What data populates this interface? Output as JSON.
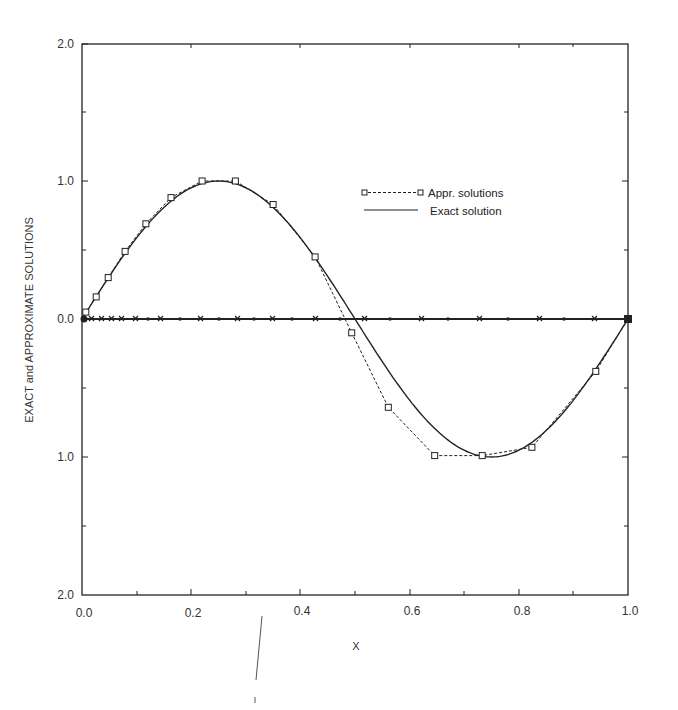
{
  "chart_data": {
    "type": "line",
    "title": "",
    "xlabel": "X",
    "ylabel": "EXACT and APPROXIMATE SOLUTIONS",
    "xlim": [
      0.0,
      1.0
    ],
    "ylim": [
      -2.0,
      2.0
    ],
    "x_ticks": [
      "0.0",
      "0.2",
      "0.4",
      "0.6",
      "0.8",
      "1.0"
    ],
    "y_ticks": [
      "2.0",
      "1.0",
      "0.0",
      "1.0",
      "2.0"
    ],
    "y_tick_values": [
      2.0,
      1.0,
      0.0,
      -1.0,
      -2.0
    ],
    "grid": false,
    "legend_position": "upper right (inside)",
    "legend": [
      {
        "label": "Appr. solutions",
        "style": "dashed line with square markers"
      },
      {
        "label": "Exact solution",
        "style": "solid line"
      }
    ],
    "series": [
      {
        "name": "Appr. solutions",
        "marker": "square",
        "line": "dashed",
        "x": [
          0.0,
          0.007,
          0.026,
          0.048,
          0.079,
          0.117,
          0.163,
          0.22,
          0.281,
          0.35,
          0.427,
          0.494,
          0.561,
          0.646,
          0.733,
          0.824,
          0.941,
          1.0
        ],
        "y": [
          0.0,
          0.05,
          0.16,
          0.3,
          0.49,
          0.69,
          0.88,
          1.0,
          1.0,
          0.83,
          0.45,
          -0.1,
          -0.64,
          -0.99,
          -0.99,
          -0.93,
          -0.38,
          0.0
        ]
      },
      {
        "name": "Exact solution",
        "line": "solid",
        "function": "sin(2*pi*x)",
        "x": [
          0.0,
          0.1,
          0.2,
          0.25,
          0.3,
          0.4,
          0.5,
          0.6,
          0.7,
          0.75,
          0.8,
          0.9,
          1.0
        ],
        "y": [
          0.0,
          0.588,
          0.951,
          1.0,
          0.951,
          0.588,
          0.0,
          -0.588,
          -0.951,
          -1.0,
          -0.951,
          -0.588,
          0.0
        ]
      },
      {
        "name": "zero baseline (x and dot markers)",
        "line": "solid",
        "marker": "x / dot alternating",
        "x": [
          0.0,
          0.018,
          0.036,
          0.054,
          0.073,
          0.1,
          0.128,
          0.165,
          0.201,
          0.238,
          0.284,
          0.33,
          0.385,
          0.44,
          0.495,
          0.55,
          0.605,
          0.66,
          0.715,
          0.77,
          0.825,
          0.88,
          0.94,
          1.0
        ],
        "y": [
          0,
          0,
          0,
          0,
          0,
          0,
          0,
          0,
          0,
          0,
          0,
          0,
          0,
          0,
          0,
          0,
          0,
          0,
          0,
          0,
          0,
          0,
          0,
          0
        ]
      }
    ]
  },
  "axes": {
    "x_title": "X",
    "y_title": "EXACT and APPROXIMATE SOLUTIONS",
    "x_tick_labels": [
      "0.0",
      "0.2",
      "0.4",
      "0.6",
      "0.8",
      "1.0"
    ],
    "y_tick_labels": [
      "2.0",
      "1.0",
      "0.0",
      "1.0",
      "2.0"
    ]
  },
  "legend": {
    "appr_label": "Appr. solutions",
    "exact_label": "Exact solution"
  }
}
